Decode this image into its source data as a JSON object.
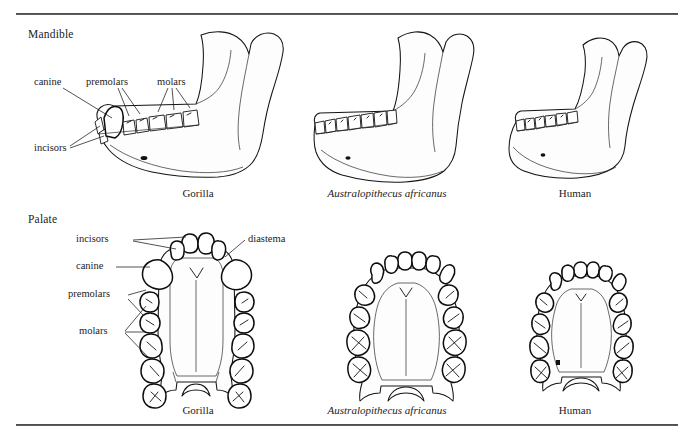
{
  "figure": {
    "sections": [
      {
        "id": "mandible",
        "header": "Mandible"
      },
      {
        "id": "palate",
        "header": "Palate"
      }
    ],
    "mandible_row": {
      "captions": [
        {
          "id": "gorilla",
          "text": "Gorilla",
          "style": "roman"
        },
        {
          "id": "australopithecus",
          "text": "Australopithecus africanus",
          "style": "italic"
        },
        {
          "id": "human",
          "text": "Human",
          "style": "roman"
        }
      ],
      "annotations": [
        {
          "id": "canine",
          "text": "canine"
        },
        {
          "id": "premolars",
          "text": "premolars"
        },
        {
          "id": "molars",
          "text": "molars"
        },
        {
          "id": "incisors",
          "text": "incisors"
        }
      ]
    },
    "palate_row": {
      "captions": [
        {
          "id": "gorilla",
          "text": "Gorilla",
          "style": "roman"
        },
        {
          "id": "australopithecus",
          "text": "Australopithecus africanus",
          "style": "italic"
        },
        {
          "id": "human",
          "text": "Human",
          "style": "roman"
        }
      ],
      "annotations": [
        {
          "id": "incisors",
          "text": "incisors"
        },
        {
          "id": "diastema",
          "text": "diastema"
        },
        {
          "id": "canine",
          "text": "canine"
        },
        {
          "id": "premolars",
          "text": "premolars"
        },
        {
          "id": "molars",
          "text": "molars"
        }
      ]
    },
    "colors": {
      "ink": "#141414",
      "rule": "#2f2f2f",
      "paper": "#ffffff",
      "stipple": "#3a3a3a"
    }
  }
}
